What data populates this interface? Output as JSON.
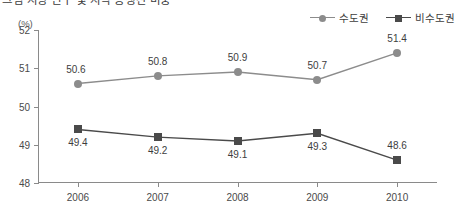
{
  "chart_title": "그림 지방 인구 및 지역 총생산 비중",
  "axis_unit": "(%)",
  "legend": {
    "position": "top-right",
    "items": [
      {
        "label": "수도권",
        "marker": "circle",
        "color": "#8c8c8c"
      },
      {
        "label": "비수도권",
        "marker": "square",
        "color": "#4a4a4a"
      }
    ]
  },
  "chart_data": {
    "type": "line",
    "title": "그림 지방 인구 및 지역 총생산 비중",
    "xlabel": "",
    "ylabel": "(%)",
    "categories": [
      "2006",
      "2007",
      "2008",
      "2009",
      "2010"
    ],
    "ylim": [
      48,
      52
    ],
    "yticks": [
      "48",
      "49",
      "50",
      "51",
      "52"
    ],
    "grid": false,
    "legend_position": "top-right",
    "series": [
      {
        "name": "수도권",
        "marker": "circle",
        "color": "#8c8c8c",
        "values": [
          50.6,
          50.8,
          50.9,
          50.7,
          51.4
        ],
        "labels": [
          "50.6",
          "50.8",
          "50.9",
          "50.7",
          "51.4"
        ],
        "label_positions": [
          "left-above",
          "above",
          "above",
          "above",
          "above"
        ]
      },
      {
        "name": "비수도권",
        "marker": "square",
        "color": "#4a4a4a",
        "values": [
          49.4,
          49.2,
          49.1,
          49.3,
          48.6
        ],
        "labels": [
          "49.4",
          "49.2",
          "49.1",
          "49.3",
          "48.6"
        ],
        "label_positions": [
          "below",
          "below",
          "below",
          "below",
          "above"
        ]
      }
    ]
  }
}
